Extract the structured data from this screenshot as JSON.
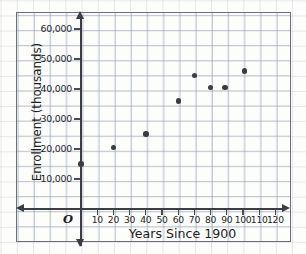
{
  "chart_data": {
    "type": "scatter",
    "title": "",
    "xlabel": "Years Since 1900",
    "ylabel": "Enrollment (thousands)",
    "origin_label": "O",
    "xlim": [
      0,
      125
    ],
    "ylim": [
      0,
      65000
    ],
    "grid": true,
    "legend": null,
    "xticks": [
      10,
      20,
      30,
      40,
      50,
      60,
      70,
      80,
      90,
      100,
      110,
      120
    ],
    "xtick_labels": [
      "10",
      "20",
      "30",
      "40",
      "50",
      "60",
      "70",
      "80",
      "90",
      "100",
      "110",
      "120"
    ],
    "yticks": [
      10000,
      20000,
      30000,
      40000,
      50000,
      60000
    ],
    "ytick_labels": [
      "10,000",
      "20,000",
      "30,000",
      "40,000",
      "50,000",
      "60,000"
    ],
    "points": [
      {
        "x": 0,
        "y": 15000
      },
      {
        "x": 20,
        "y": 20500
      },
      {
        "x": 40,
        "y": 25000
      },
      {
        "x": 60,
        "y": 36000
      },
      {
        "x": 70,
        "y": 44500
      },
      {
        "x": 80,
        "y": 40500
      },
      {
        "x": 89,
        "y": 40500
      },
      {
        "x": 101,
        "y": 46000
      }
    ],
    "marker_color": "#3a3c41",
    "axis_color": "#3b3d42",
    "grid_color": "#96a2b0"
  }
}
